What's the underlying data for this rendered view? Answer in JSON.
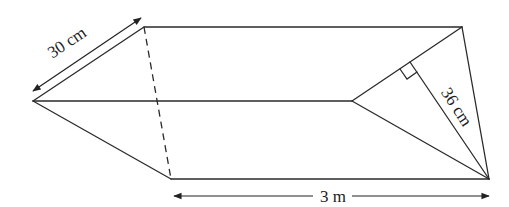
{
  "diagram": {
    "type": "triangular-prism",
    "labels": {
      "side": "30 cm",
      "height": "36 cm",
      "length": "3 m"
    },
    "vertices": {
      "front_top": [
        144,
        27
      ],
      "front_left": [
        33,
        101
      ],
      "front_bottom": [
        171,
        179
      ],
      "back_top": [
        462,
        27
      ],
      "back_left": [
        352,
        101
      ],
      "back_bottom": [
        489,
        179
      ]
    },
    "right_angle_marker": true,
    "colors": {
      "line": "#2a2a2a",
      "background": "#ffffff"
    }
  }
}
